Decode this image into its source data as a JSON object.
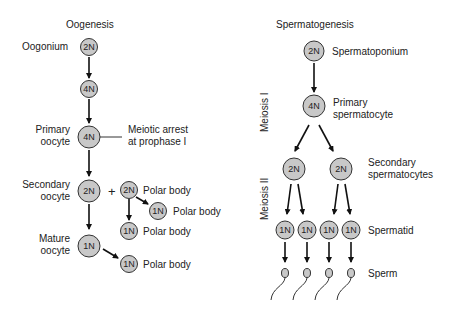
{
  "oogenesis": {
    "title": "Oogenesis",
    "stages": {
      "oogonium": {
        "label": "Oogonium",
        "ploidy": "2N"
      },
      "intermediate": {
        "ploidy": "4N"
      },
      "primary": {
        "label_line1": "Primary",
        "label_line2": "oocyte",
        "ploidy": "4N",
        "note_line1": "Meiotic arrest",
        "note_line2": "at prophase I"
      },
      "secondary": {
        "label_line1": "Secondary",
        "label_line2": "oocyte",
        "ploidy": "2N",
        "plus": "+"
      },
      "mature": {
        "label_line1": "Mature",
        "label_line2": "oocyte",
        "ploidy": "1N"
      }
    },
    "polar_bodies": [
      {
        "ploidy": "2N",
        "label": "Polar body"
      },
      {
        "ploidy": "1N",
        "label": "Polar body"
      },
      {
        "ploidy": "1N",
        "label": "Polar body"
      },
      {
        "ploidy": "1N",
        "label": "Polar body"
      }
    ]
  },
  "spermatogenesis": {
    "title": "Spermatogenesis",
    "phase_labels": {
      "meiosis1": "Meiosis I",
      "meiosis2": "Meiosis II"
    },
    "spermatogonium": {
      "label": "Spermatoponium",
      "ploidy": "2N"
    },
    "primary": {
      "label_line1": "Primary",
      "label_line2": "spermatocyte",
      "ploidy": "4N"
    },
    "secondary": {
      "label_line1": "Secondary",
      "label_line2": "spermatocytes",
      "ploidy": [
        "2N",
        "2N"
      ]
    },
    "spermatid": {
      "label": "Spermatid",
      "ploidy": [
        "1N",
        "1N",
        "1N",
        "1N"
      ]
    },
    "sperm": {
      "label": "Sperm"
    }
  }
}
